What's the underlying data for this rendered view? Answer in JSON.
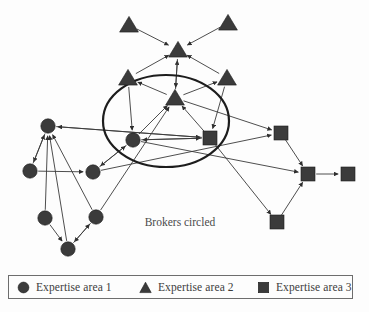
{
  "figure": {
    "caption": "Brokers circled",
    "caption_position": {
      "x": 180,
      "y": 226
    },
    "background_color": "#fdfdfd",
    "node_fill_color": "#3b3b3b",
    "edge_color": "#3a3a3a",
    "broker_ring_color": "#1d1d1d",
    "width": 369,
    "height": 312
  },
  "broker_ring": {
    "name": "brokers-ellipse",
    "cx": 166,
    "cy": 121,
    "rx": 63,
    "ry": 46
  },
  "chart_data": {
    "type": "network-diagram",
    "annotation": "Brokers circled",
    "node_types": [
      {
        "id": "circle",
        "label": "Expertise area 1",
        "glyph": "circle"
      },
      {
        "id": "triangle",
        "label": "Expertise area 2",
        "glyph": "triangle"
      },
      {
        "id": "square",
        "label": "Expertise area 3",
        "glyph": "square"
      }
    ],
    "nodes": [
      {
        "id": "t1",
        "type": "triangle",
        "x": 129,
        "y": 25,
        "broker": false
      },
      {
        "id": "t2",
        "type": "triangle",
        "x": 228,
        "y": 23,
        "broker": false
      },
      {
        "id": "t3",
        "type": "triangle",
        "x": 178,
        "y": 50,
        "broker": false
      },
      {
        "id": "t4",
        "type": "triangle",
        "x": 128,
        "y": 78,
        "broker": false
      },
      {
        "id": "t5",
        "type": "triangle",
        "x": 227,
        "y": 78,
        "broker": false
      },
      {
        "id": "t6",
        "type": "triangle",
        "x": 175,
        "y": 98,
        "broker": true
      },
      {
        "id": "c1",
        "type": "circle",
        "x": 133,
        "y": 140,
        "broker": true
      },
      {
        "id": "s1",
        "type": "square",
        "x": 210,
        "y": 138,
        "broker": true
      },
      {
        "id": "c2",
        "type": "circle",
        "x": 48,
        "y": 126,
        "broker": false
      },
      {
        "id": "c3",
        "type": "circle",
        "x": 30,
        "y": 171,
        "broker": false
      },
      {
        "id": "c4",
        "type": "circle",
        "x": 93,
        "y": 172,
        "broker": false
      },
      {
        "id": "c5",
        "type": "circle",
        "x": 45,
        "y": 218,
        "broker": false
      },
      {
        "id": "c6",
        "type": "circle",
        "x": 96,
        "y": 217,
        "broker": false
      },
      {
        "id": "c7",
        "type": "circle",
        "x": 68,
        "y": 249,
        "broker": false
      },
      {
        "id": "s2",
        "type": "square",
        "x": 281,
        "y": 133,
        "broker": false
      },
      {
        "id": "s3",
        "type": "square",
        "x": 308,
        "y": 174,
        "broker": false
      },
      {
        "id": "s4",
        "type": "square",
        "x": 348,
        "y": 174,
        "broker": false
      },
      {
        "id": "s5",
        "type": "square",
        "x": 277,
        "y": 222,
        "broker": false
      }
    ],
    "edges": [
      {
        "from": "t1",
        "to": "t3"
      },
      {
        "from": "t2",
        "to": "t3"
      },
      {
        "from": "t4",
        "to": "t3"
      },
      {
        "from": "t5",
        "to": "t3"
      },
      {
        "from": "t6",
        "to": "t3"
      },
      {
        "from": "t3",
        "to": "t6"
      },
      {
        "from": "t6",
        "to": "t4"
      },
      {
        "from": "t6",
        "to": "t5"
      },
      {
        "from": "t4",
        "to": "c1"
      },
      {
        "from": "t5",
        "to": "s1"
      },
      {
        "from": "c1",
        "to": "t6"
      },
      {
        "from": "s1",
        "to": "t6"
      },
      {
        "from": "c1",
        "to": "s1"
      },
      {
        "from": "s1",
        "to": "c1"
      },
      {
        "from": "c2",
        "to": "s1"
      },
      {
        "from": "s1",
        "to": "c2"
      },
      {
        "from": "c1",
        "to": "c4"
      },
      {
        "from": "c4",
        "to": "c1"
      },
      {
        "from": "c2",
        "to": "c3"
      },
      {
        "from": "c3",
        "to": "c2"
      },
      {
        "from": "c5",
        "to": "c2"
      },
      {
        "from": "c6",
        "to": "c2"
      },
      {
        "from": "c7",
        "to": "c2"
      },
      {
        "from": "c3",
        "to": "c4"
      },
      {
        "from": "c5",
        "to": "c7"
      },
      {
        "from": "c6",
        "to": "c7"
      },
      {
        "from": "c7",
        "to": "c6"
      },
      {
        "from": "c6",
        "to": "t6"
      },
      {
        "from": "c4",
        "to": "s2"
      },
      {
        "from": "s2",
        "to": "s3"
      },
      {
        "from": "c1",
        "to": "s3"
      },
      {
        "from": "s3",
        "to": "s4"
      },
      {
        "from": "s5",
        "to": "s3"
      },
      {
        "from": "s1",
        "to": "s5"
      },
      {
        "from": "t6",
        "to": "s2"
      }
    ]
  },
  "legend": {
    "name": "expertise-legend",
    "items": [
      {
        "glyph": "circle",
        "label": "Expertise area 1"
      },
      {
        "glyph": "triangle",
        "label": "Expertise area 2"
      },
      {
        "glyph": "square",
        "label": "Expertise area 3"
      }
    ]
  }
}
